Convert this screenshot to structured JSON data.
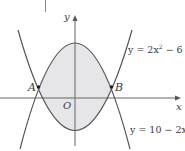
{
  "figure": {
    "type": "diagram",
    "colors": {
      "curve": "#555555",
      "axis": "#666666",
      "shade": "#e6e6e8",
      "text": "#3a3a3a"
    },
    "axes": {
      "x_label": "x",
      "y_label": "y",
      "origin_label": "O"
    },
    "curves": [
      {
        "id": "upper",
        "equation_prefix": "y = 2x",
        "equation_exp": "2",
        "equation_suffix": " − 6",
        "equation": "y = 2x² − 6"
      },
      {
        "id": "lower",
        "equation_prefix": "y = 10 − 2x",
        "equation_exp": "2",
        "equation_suffix": "",
        "equation": "y = 10 − 2x²"
      }
    ],
    "points": [
      {
        "label": "A",
        "x": -2,
        "y": 2
      },
      {
        "label": "B",
        "x": 2,
        "y": 2
      }
    ]
  }
}
